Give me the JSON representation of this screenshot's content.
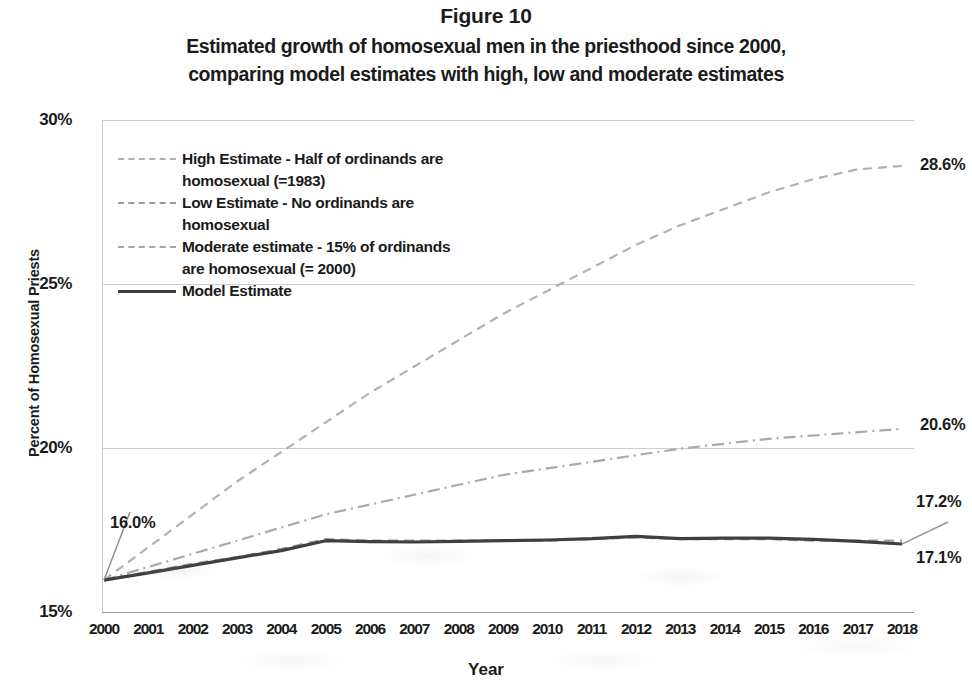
{
  "figure": {
    "number": "Figure 10",
    "title_line1": "Estimated growth of homosexual men in the priesthood since 2000,",
    "title_line2": "comparing model estimates with high, low and moderate estimates"
  },
  "axes": {
    "y_title": "Percent of Homosexual Priests",
    "x_title": "Year",
    "y_ticks": [
      "15%",
      "20%",
      "25%",
      "30%"
    ],
    "x_ticks": [
      "2000",
      "2001",
      "2002",
      "2003",
      "2004",
      "2005",
      "2006",
      "2007",
      "2008",
      "2009",
      "2010",
      "2011",
      "2012",
      "2013",
      "2014",
      "2015",
      "2016",
      "2017",
      "2018"
    ]
  },
  "legend": {
    "items": [
      {
        "label": "High Estimate - Half of ordinands are\nhomosexual (=1983)",
        "style": "high"
      },
      {
        "label": "Low Estimate - No ordinands are\nhomosexual",
        "style": "low"
      },
      {
        "label": "Moderate estimate - 15% of ordinands\nare homosexual (= 2000)",
        "style": "mod"
      },
      {
        "label": "Model Estimate",
        "style": "model"
      }
    ]
  },
  "annotations": {
    "start_label": "16.0%",
    "high_end_label": "28.6%",
    "moderate_end_label": "20.6%",
    "low_end_label": "17.2%",
    "model_end_label": "17.1%"
  },
  "colors": {
    "text": "#1b1b1b",
    "grid": "#cdcdcd",
    "model_line": "#3c3c3c",
    "estimate_line": "#a8a8a8"
  },
  "chart_data": {
    "type": "line",
    "title": "Estimated growth of homosexual men in the priesthood since 2000, comparing model estimates with high, low and moderate estimates",
    "xlabel": "Year",
    "ylabel": "Percent of Homosexual Priests",
    "ylim": [
      15,
      30
    ],
    "yticks": [
      15,
      20,
      25,
      30
    ],
    "grid": true,
    "legend_position": "upper-left-inside",
    "categories": [
      "2000",
      "2001",
      "2002",
      "2003",
      "2004",
      "2005",
      "2006",
      "2007",
      "2008",
      "2009",
      "2010",
      "2011",
      "2012",
      "2013",
      "2014",
      "2015",
      "2016",
      "2017",
      "2018"
    ],
    "series": [
      {
        "name": "High Estimate - Half of ordinands are homosexual (=1983)",
        "style": "dashed",
        "end_label": "28.6%",
        "values": [
          16.0,
          17.0,
          18.0,
          19.0,
          19.9,
          20.8,
          21.7,
          22.5,
          23.3,
          24.1,
          24.8,
          25.5,
          26.2,
          26.8,
          27.3,
          27.8,
          28.2,
          28.5,
          28.6
        ]
      },
      {
        "name": "Low Estimate - No ordinands are homosexual",
        "style": "dashed",
        "end_label": "17.2%",
        "values": [
          16.0,
          16.25,
          16.5,
          16.7,
          16.95,
          17.25,
          17.2,
          17.2,
          17.2,
          17.2,
          17.2,
          17.25,
          17.3,
          17.25,
          17.25,
          17.25,
          17.2,
          17.2,
          17.2
        ]
      },
      {
        "name": "Moderate estimate - 15% of ordinands are homosexual (= 2000)",
        "style": "dash-dot",
        "end_label": "20.6%",
        "values": [
          16.0,
          16.4,
          16.8,
          17.2,
          17.6,
          18.0,
          18.3,
          18.6,
          18.9,
          19.2,
          19.4,
          19.6,
          19.8,
          20.0,
          20.15,
          20.3,
          20.4,
          20.5,
          20.6
        ]
      },
      {
        "name": "Model Estimate",
        "style": "solid",
        "start_label": "16.0%",
        "end_label": "17.1%",
        "values": [
          16.0,
          16.22,
          16.45,
          16.68,
          16.9,
          17.2,
          17.17,
          17.16,
          17.18,
          17.2,
          17.22,
          17.26,
          17.33,
          17.26,
          17.28,
          17.28,
          17.24,
          17.18,
          17.1
        ]
      }
    ]
  }
}
